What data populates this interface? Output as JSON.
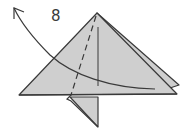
{
  "diagram": {
    "type": "origami-fold-step",
    "step_number": "8",
    "colors": {
      "paper_fill": "#cfcfcf",
      "line": "#3a3a3a",
      "background": "#ffffff"
    },
    "elements": [
      "triangle-front-layer",
      "triangle-back-layer",
      "center-crease-line",
      "valley-fold-dashed-line",
      "bottom-flap",
      "curved-fold-arrow"
    ]
  }
}
